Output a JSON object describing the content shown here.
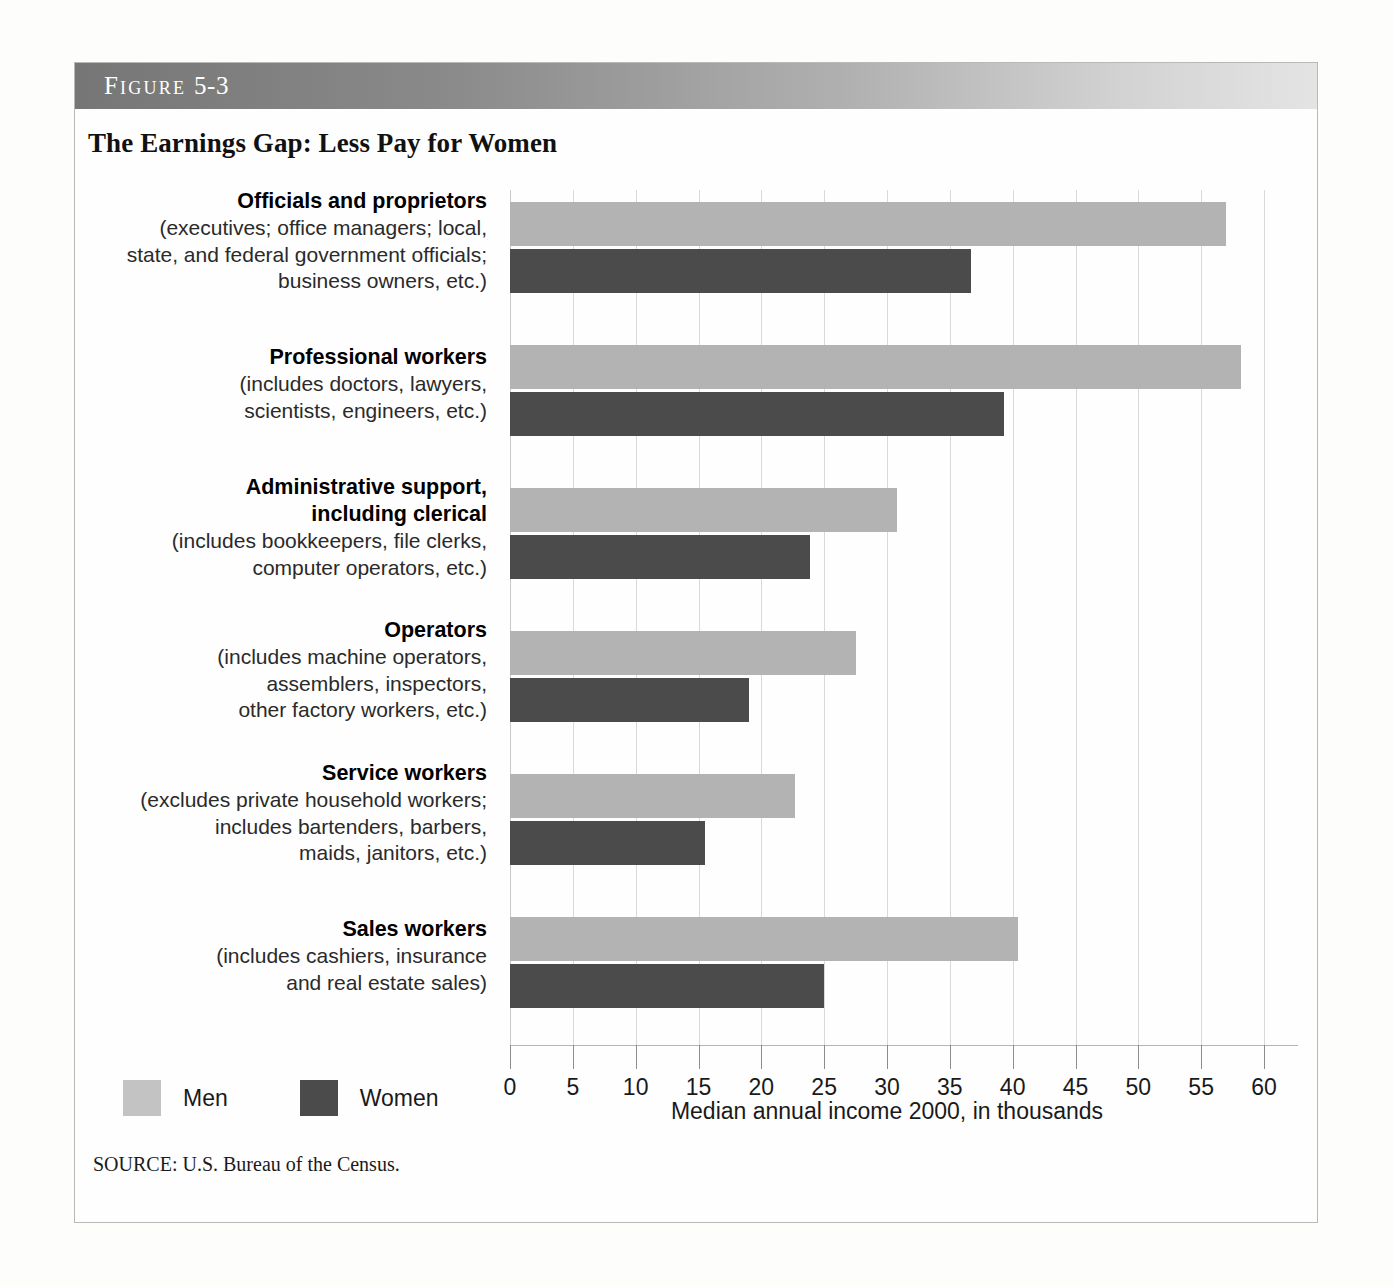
{
  "figure": {
    "label_prefix": "Figure",
    "label_number": "5-3",
    "title": "The Earnings Gap: Less Pay for Women",
    "source": "SOURCE: U.S. Bureau of the Census."
  },
  "legend": {
    "items": [
      {
        "name": "Men",
        "color": "#c3c3c3"
      },
      {
        "name": "Women",
        "color": "#4b4b4b"
      }
    ]
  },
  "chart_data": {
    "type": "bar",
    "orientation": "horizontal",
    "title": "The Earnings Gap: Less Pay for Women",
    "xlabel": "Median annual income 2000, in thousands",
    "ylabel": "",
    "xlim": [
      0,
      60
    ],
    "xticks": [
      0,
      5,
      10,
      15,
      20,
      25,
      30,
      35,
      40,
      45,
      50,
      55,
      60
    ],
    "xticklabels": [
      "0",
      "5",
      "10",
      "15",
      "20",
      "25",
      "30",
      "35",
      "40",
      "45",
      "50",
      "55",
      "60"
    ],
    "grid": true,
    "legend_position": "bottom-left",
    "categories": [
      "Officials and proprietors",
      "Professional workers",
      "Administrative support, including clerical",
      "Operators",
      "Service workers",
      "Sales workers"
    ],
    "category_labels": [
      {
        "head": [
          "Officials and proprietors"
        ],
        "sub": [
          "(executives; office managers; local,",
          "state, and federal government officials;",
          "business owners, etc.)"
        ]
      },
      {
        "head": [
          "Professional workers"
        ],
        "sub": [
          "(includes doctors, lawyers,",
          "scientists, engineers, etc.)"
        ]
      },
      {
        "head": [
          "Administrative support,",
          "including clerical"
        ],
        "sub": [
          "(includes bookkeepers, file clerks,",
          "computer operators, etc.)"
        ]
      },
      {
        "head": [
          "Operators"
        ],
        "sub": [
          "(includes machine operators,",
          "assemblers, inspectors,",
          "other factory workers, etc.)"
        ]
      },
      {
        "head": [
          "Service workers"
        ],
        "sub": [
          "(excludes private household workers;",
          "includes bartenders, barbers,",
          "maids, janitors, etc.)"
        ]
      },
      {
        "head": [
          "Sales workers"
        ],
        "sub": [
          "(includes cashiers, insurance",
          "and real estate sales)"
        ]
      }
    ],
    "series": [
      {
        "name": "Men",
        "color": "#b3b3b3",
        "values": [
          57.0,
          58.2,
          30.8,
          27.5,
          22.7,
          40.4
        ]
      },
      {
        "name": "Women",
        "color": "#4b4b4b",
        "values": [
          36.7,
          39.3,
          23.9,
          19.0,
          15.5,
          25.0
        ]
      }
    ]
  }
}
